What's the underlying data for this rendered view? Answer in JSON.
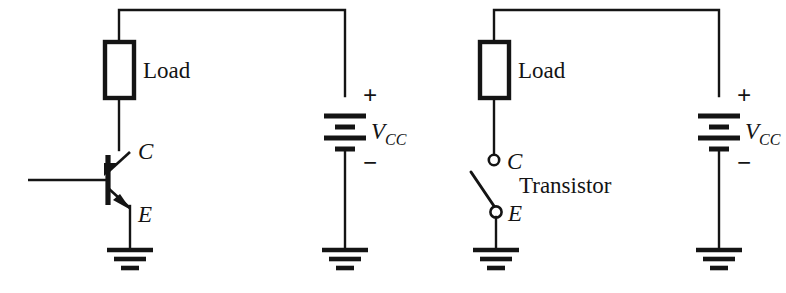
{
  "figure": {
    "name": "transistor-as-switch-equivalent-circuits",
    "background": "#ffffff",
    "ink_color": "#141414",
    "width": 786,
    "height": 293
  },
  "circuits": [
    {
      "id": "transistor-circuit",
      "load_label": "Load",
      "supply_label": "V",
      "supply_subscript": "CC",
      "plus_sign": "+",
      "minus_sign": "−",
      "collector_label": "C",
      "emitter_label": "E",
      "device": "npn-transistor",
      "device_label": ""
    },
    {
      "id": "switch-equivalent-circuit",
      "load_label": "Load",
      "supply_label": "V",
      "supply_subscript": "CC",
      "plus_sign": "+",
      "minus_sign": "−",
      "collector_label": "C",
      "emitter_label": "E",
      "device": "open-switch",
      "device_label": "Transistor"
    }
  ]
}
